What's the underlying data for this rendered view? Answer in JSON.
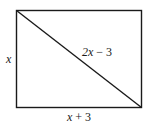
{
  "diagram": {
    "shape": "rectangle-with-diagonal",
    "labels": {
      "height": "x",
      "diagonal_var": "2x",
      "diagonal_rest": " − 3",
      "width_var": "x",
      "width_rest": " + 3"
    },
    "colors": {
      "stroke": "#1a1a1a",
      "background": "#ffffff"
    }
  }
}
